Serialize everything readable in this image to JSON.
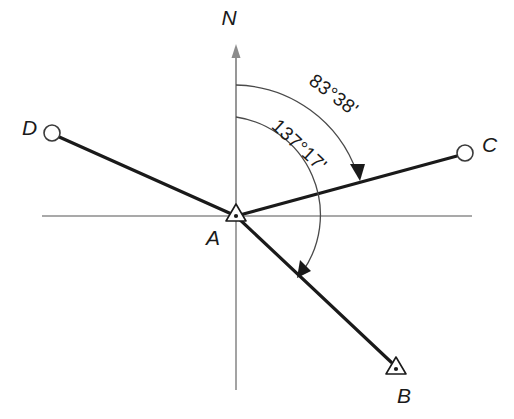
{
  "diagram": {
    "background_color": "#ffffff",
    "ray_color": "#1a1a1a",
    "axis_color": "#8c8c8c",
    "arc_color": "#4a4a4a",
    "center_station": {
      "label": "A",
      "marker": "triangle-with-dot",
      "x": 236,
      "y": 216,
      "label_x": 213,
      "label_y": 245
    },
    "north": {
      "label": "N",
      "label_x": 229,
      "label_y": 25,
      "arrow_tip_y": 50,
      "axis_top_y": 50,
      "axis_bottom_y": 390
    },
    "horizontal_axis": {
      "x_start": 42,
      "x_end": 472,
      "y": 216
    },
    "stations": [
      {
        "label": "B",
        "marker": "triangle-with-dot",
        "x": 396,
        "y": 368,
        "label_x": 404,
        "label_y": 403,
        "bearing_deg": 137.283
      },
      {
        "label": "C",
        "marker": "open-circle",
        "x": 465,
        "y": 153,
        "label_x": 482,
        "label_y": 152,
        "bearing_deg": 83.633
      },
      {
        "label": "D",
        "marker": "open-circle",
        "x": 52,
        "y": 133,
        "label_x": 22,
        "label_y": 135,
        "bearing_deg": 294.3
      }
    ],
    "angles": [
      {
        "name": "bearing-to-C",
        "value": "83°38'",
        "degrees": 83,
        "minutes": 38,
        "from": "N",
        "to": "C",
        "arc_radius": 131,
        "label_cx": 330,
        "label_cy": 100
      },
      {
        "name": "bearing-to-B",
        "value": "137°17'",
        "degrees": 137,
        "minutes": 17,
        "from": "N",
        "to": "B",
        "arc_radius": 99,
        "label_cx": 295,
        "label_cy": 150
      }
    ]
  }
}
